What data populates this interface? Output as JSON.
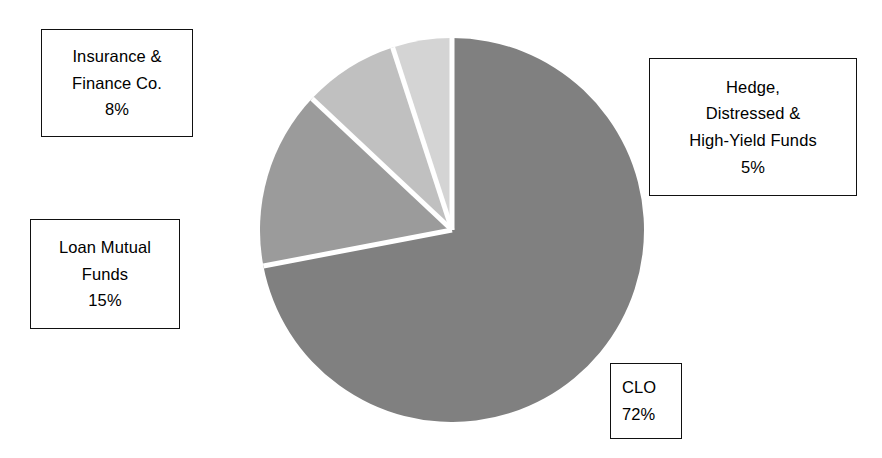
{
  "chart_data": {
    "type": "pie",
    "title": "",
    "subtitle": "",
    "xlabel": "",
    "ylabel": "",
    "legend_position": "callout-boxes",
    "grid": false,
    "start_angle_deg": 0,
    "direction": "clockwise",
    "categories": [
      "CLO",
      "Loan Mutual Funds",
      "Insurance & Finance Co.",
      "Hedge, Distressed & High-Yield Funds"
    ],
    "values": [
      72,
      15,
      8,
      5
    ],
    "unit": "%",
    "colors": [
      "#808080",
      "#9b9b9b",
      "#c0c0c0",
      "#d4d4d4"
    ],
    "separator_color": "#ffffff",
    "slices": [
      {
        "id": "clo",
        "label": "CLO",
        "value": 72,
        "value_label": "72%",
        "color": "#808080",
        "start_deg": 0,
        "end_deg": 259.2
      },
      {
        "id": "loan-mutual-funds",
        "label": "Loan Mutual Funds",
        "value": 15,
        "value_label": "15%",
        "color": "#9b9b9b",
        "start_deg": 259.2,
        "end_deg": 313.2
      },
      {
        "id": "insurance-finance-co",
        "label": "Insurance & Finance Co.",
        "value": 8,
        "value_label": "8%",
        "color": "#c0c0c0",
        "start_deg": 313.2,
        "end_deg": 342.0
      },
      {
        "id": "hedge-distressed-high-yield-funds",
        "label": "Hedge, Distressed & High-Yield Funds",
        "value": 5,
        "value_label": "5%",
        "color": "#d4d4d4",
        "start_deg": 342.0,
        "end_deg": 360.0
      }
    ]
  },
  "callouts": {
    "insurance": {
      "line1": "Insurance &",
      "line2": "Finance Co.",
      "line3": "8%"
    },
    "loan": {
      "line1": "Loan Mutual",
      "line2": "Funds",
      "line3": "15%"
    },
    "hedge": {
      "line1": "Hedge,",
      "line2": "Distressed &",
      "line3": "High-Yield Funds",
      "line4": "5%"
    },
    "clo": {
      "line1": "CLO",
      "line2": "72%"
    }
  }
}
